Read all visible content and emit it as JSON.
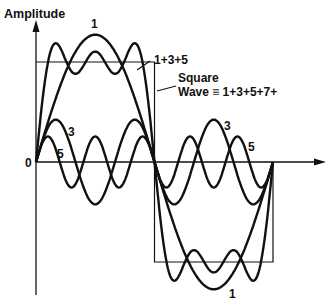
{
  "labels": {
    "ylabel": "Amplitude",
    "origin": "0",
    "fundamental_top": "1",
    "fundamental_bottom": "1",
    "sum": "1+3+5",
    "square_line1": "Square",
    "square_line2": "Wave ≡ 1+3+5+7+",
    "third": "3",
    "third_right": "3",
    "fifth": "5",
    "fifth_right": "5"
  },
  "geometry": {
    "x0": 36,
    "x_end": 273,
    "y0": 162,
    "square_amp": 100
  },
  "chart_data": {
    "type": "line",
    "xlabel": "",
    "ylabel": "Amplitude",
    "series": [
      {
        "name": "1",
        "harmonic": 1,
        "relative_amplitude": 1.273
      },
      {
        "name": "3",
        "harmonic": 3,
        "relative_amplitude": 0.424
      },
      {
        "name": "5",
        "harmonic": 5,
        "relative_amplitude": 0.255
      },
      {
        "name": "1+3+5",
        "components": [
          1,
          3,
          5
        ]
      },
      {
        "name": "Square Wave ≡ 1+3+5+7+",
        "amplitude": 1.0
      }
    ],
    "x_range": [
      0,
      1
    ],
    "periods": 1
  }
}
